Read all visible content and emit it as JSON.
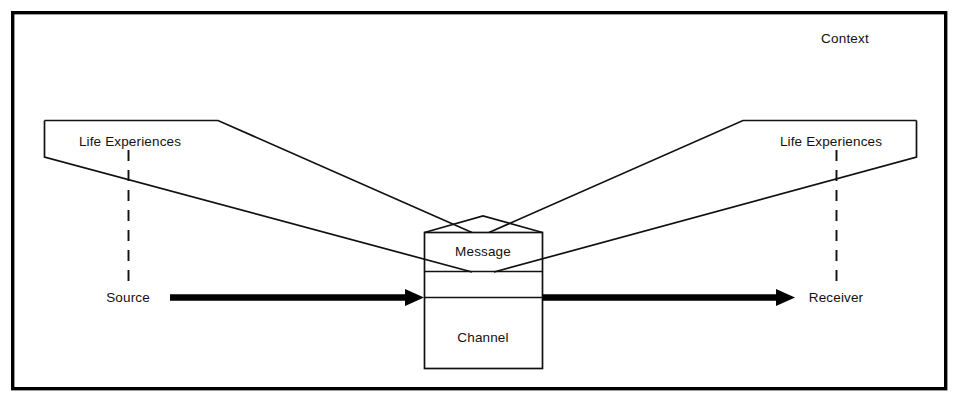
{
  "diagram": {
    "type": "process-diagram",
    "frame": {
      "label": "Context",
      "label_x": 845,
      "label_y": 43,
      "rect": {
        "x": 11,
        "y": 11,
        "width": 936,
        "height": 379
      },
      "border_color": "#000000"
    },
    "palette": {
      "ink": "#111111",
      "frame": "#000000",
      "background": "#ffffff"
    },
    "nodes": [
      {
        "id": "life-experiences-left",
        "label": "Life Experiences",
        "label_x": 130,
        "label_y": 146,
        "shape": "quadrilateral",
        "points": "44,120 218,120 472,232 44,157"
      },
      {
        "id": "life-experiences-right",
        "label": "Life Experiences",
        "label_x": 831,
        "label_y": 146,
        "shape": "quadrilateral",
        "points": "917,120 743,120 489,232 917,157"
      },
      {
        "id": "message",
        "label": "Message",
        "label_x": 483,
        "label_y": 256,
        "shape": "pentagon-top",
        "box": {
          "x": 424,
          "y": 232,
          "width": 118,
          "height": 136
        },
        "apex_x": 483,
        "apex_y": 216
      },
      {
        "id": "channel",
        "label": "Channel",
        "label_x": 483,
        "label_y": 342,
        "shape": "box-section",
        "divider_top_y": 271,
        "divider_bottom_y": 298
      },
      {
        "id": "source",
        "label": "Source",
        "label_x": 128,
        "label_y": 302
      },
      {
        "id": "receiver",
        "label": "Receiver",
        "label_x": 836,
        "label_y": 302
      }
    ],
    "connectors": [
      {
        "id": "source-to-channel-arrow",
        "kind": "arrow",
        "from_x": 170,
        "to_x": 424,
        "y": 297,
        "direction": "right"
      },
      {
        "id": "channel-to-receiver-arrow",
        "kind": "arrow",
        "from_x": 542,
        "to_x": 795,
        "y": 297,
        "direction": "right"
      },
      {
        "id": "source-dashed-connector",
        "kind": "dashed-vertical",
        "x": 128,
        "from_y": 150,
        "to_y": 290
      },
      {
        "id": "receiver-dashed-connector",
        "kind": "dashed-vertical",
        "x": 836,
        "from_y": 150,
        "to_y": 290
      }
    ]
  }
}
